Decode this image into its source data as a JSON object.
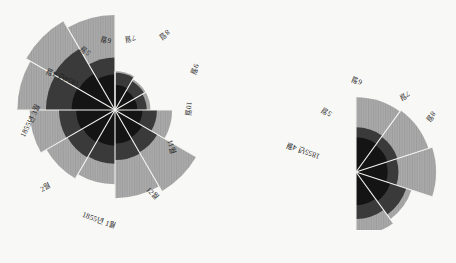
{
  "figure": {
    "kind": "nightingale-rose-diagram",
    "background_color": "#f8f8f6",
    "colors": {
      "outer_wedge": "#9e9e9e",
      "middle_wedge": "#3a3a3a",
      "inner_wedge": "#141414",
      "separator": "#f3f3f1",
      "label_text": "#1d1d1d"
    }
  },
  "chart_data": [
    {
      "type": "pie",
      "id": "left-rose",
      "subtype": "nightingale-rose",
      "title": "",
      "angular_extent_deg": 360,
      "slices": 12,
      "start_angle_deg": -90,
      "direction": "clockwise",
      "categories": [
        "1854년 4월",
        "5월",
        "6월",
        "7월",
        "8월",
        "9월",
        "10월",
        "11월",
        "12월",
        "1855년 1월",
        "2월",
        "1855년 3월"
      ],
      "series": [
        {
          "name": "outer",
          "color": "#9e9e9e",
          "values": [
            12,
            10,
            10,
            26,
            70,
            62,
            44,
            50,
            58,
            76,
            84,
            72
          ]
        },
        {
          "name": "middle",
          "color": "#3a3a3a",
          "values": [
            11,
            9,
            8,
            14,
            19,
            20,
            23,
            24,
            25,
            38,
            40,
            22
          ]
        },
        {
          "name": "inner",
          "color": "#141414",
          "values": [
            5,
            4,
            4,
            6,
            8,
            9,
            10,
            11,
            12,
            15,
            14,
            10
          ]
        }
      ]
    },
    {
      "type": "pie",
      "id": "right-rose",
      "subtype": "nightingale-rose",
      "title": "",
      "angular_extent_deg": 180,
      "slices": 5,
      "start_angle_deg": -90,
      "direction": "clockwise",
      "categories": [
        "1855년 4월",
        "5월",
        "6월",
        "7월",
        "8월"
      ],
      "series": [
        {
          "name": "outer",
          "color": "#9e9e9e",
          "values": [
            56,
            58,
            64,
            34,
            40
          ]
        },
        {
          "name": "middle",
          "color": "#3a3a3a",
          "values": [
            20,
            19,
            18,
            28,
            22
          ]
        },
        {
          "name": "inner",
          "color": "#141414",
          "values": [
            12,
            11,
            10,
            13,
            11
          ]
        }
      ]
    }
  ],
  "labels": {
    "left": [
      {
        "text": "1854년 4월",
        "x": 63,
        "y": 77,
        "rot": -157
      },
      {
        "text": "5월",
        "x": 86,
        "y": 50,
        "rot": -140
      },
      {
        "text": "6월",
        "x": 106,
        "y": 39,
        "rot": -165
      },
      {
        "text": "7월",
        "x": 130,
        "y": 38,
        "rot": 168
      },
      {
        "text": "8월",
        "x": 164,
        "y": 34,
        "rot": 142
      },
      {
        "text": "9월",
        "x": 194,
        "y": 69,
        "rot": 113
      },
      {
        "text": "10월",
        "x": 188,
        "y": 109,
        "rot": 95
      },
      {
        "text": "11월",
        "x": 171,
        "y": 147,
        "rot": 72
      },
      {
        "text": "12월",
        "x": 152,
        "y": 194,
        "rot": 46
      },
      {
        "text": "1855년 1월",
        "x": 99,
        "y": 221,
        "rot": 20
      },
      {
        "text": "2월",
        "x": 46,
        "y": 188,
        "rot": -28
      },
      {
        "text": "1855년 3월",
        "x": 31,
        "y": 121,
        "rot": -63
      }
    ],
    "right": [
      {
        "text": "1855년 4월",
        "x": 303,
        "y": 150,
        "rot": -160
      },
      {
        "text": "5월",
        "x": 327,
        "y": 111,
        "rot": -146
      },
      {
        "text": "6월",
        "x": 357,
        "y": 80,
        "rot": -158
      },
      {
        "text": "7월",
        "x": 404,
        "y": 95,
        "rot": 152
      },
      {
        "text": "8월",
        "x": 430,
        "y": 116,
        "rot": 128
      }
    ]
  }
}
